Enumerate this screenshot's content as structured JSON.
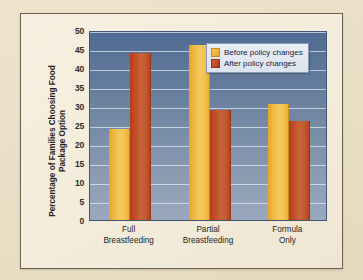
{
  "chart_data": {
    "type": "bar",
    "title": "",
    "xlabel": "",
    "ylabel": "Percentage of Families Choosing Food Package Option",
    "ylim": [
      0,
      50
    ],
    "yticks": [
      0,
      5,
      10,
      15,
      20,
      25,
      30,
      35,
      40,
      45,
      50
    ],
    "ytick_labels": [
      "0",
      "5",
      "10",
      "15",
      "20",
      "25",
      "30",
      "35",
      "40",
      "45",
      "50"
    ],
    "grid": true,
    "legend_position": "top-right",
    "categories": [
      "Full Breastfeeding",
      "Partial Breastfeeding",
      "Formula Only"
    ],
    "category_lines": [
      [
        "Full",
        "Breastfeeding"
      ],
      [
        "Partial",
        "Breastfeeding"
      ],
      [
        "Formula",
        "Only"
      ]
    ],
    "series": [
      {
        "name": "Before policy changes",
        "color": "#efb63f",
        "values": [
          24,
          46,
          30.5
        ]
      },
      {
        "name": "After policy changes",
        "color": "#bf4a22",
        "values": [
          44,
          29,
          26
        ]
      }
    ]
  },
  "legend": {
    "items": [
      {
        "label": "Before policy changes",
        "swatch": "before"
      },
      {
        "label": "After policy changes",
        "swatch": "after"
      }
    ]
  },
  "colors": {
    "page_background": "#ede0c8",
    "figure_background": "#f3ecdb",
    "figure_border": "#6b6256",
    "plot_top": "#506c94",
    "plot_bottom": "#9aa8bd",
    "gridline": "#e2ebf5",
    "series_before": "#efb63f",
    "series_after": "#bf4a22",
    "axis_text": "#1f1f1f"
  }
}
